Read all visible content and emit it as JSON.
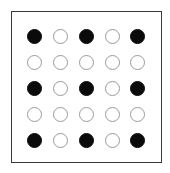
{
  "figure": {
    "background_color": "#ffffff",
    "frame": {
      "border_color": "#3a3a3a",
      "border_width_px": 1.5,
      "fill_color": "#ffffff",
      "left_px": 11,
      "top_px": 11,
      "width_px": 151,
      "height_px": 152
    },
    "dot": {
      "diameter_px": 15,
      "filled_color": "#0b0b0b",
      "open_fill_color": "#ffffff",
      "open_stroke_color": "#9a9a9a",
      "open_stroke_width_px": 1.3
    }
  },
  "chart_data": {
    "type": "heatmap",
    "title": "",
    "subtitle": "",
    "xlabel": "",
    "ylabel": "",
    "grid": false,
    "legend": [],
    "annotations": [],
    "rows": 5,
    "columns": 5,
    "row_labels": [
      "1",
      "2",
      "3",
      "4",
      "5"
    ],
    "column_labels": [
      "1",
      "2",
      "3",
      "4",
      "5"
    ],
    "value_meaning": {
      "1": "filled",
      "0": "open"
    },
    "values": [
      [
        1,
        0,
        1,
        0,
        1
      ],
      [
        0,
        0,
        0,
        0,
        0
      ],
      [
        1,
        0,
        1,
        0,
        1
      ],
      [
        0,
        0,
        0,
        0,
        0
      ],
      [
        1,
        0,
        1,
        0,
        1
      ]
    ],
    "column_centers_px": [
      35,
      61,
      87,
      113,
      138
    ],
    "row_centers_px": [
      37,
      63,
      89,
      115,
      141
    ],
    "filled_count": 9,
    "open_count": 16
  }
}
